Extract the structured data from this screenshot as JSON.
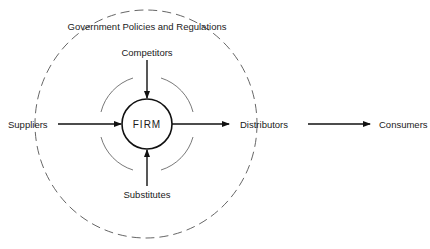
{
  "diagram": {
    "type": "environment-influence-diagram",
    "center": {
      "label": "FIRM"
    },
    "outer_boundary": {
      "label": "Government Policies and Regulations",
      "style": "dashed-circle"
    },
    "nodes": {
      "top": "Competitors",
      "bottom": "Substitutes",
      "left": "Suppliers",
      "right": "Distributors",
      "far_right": "Consumers"
    },
    "edges": [
      {
        "from": "Competitors",
        "to": "FIRM"
      },
      {
        "from": "Substitutes",
        "to": "FIRM"
      },
      {
        "from": "Suppliers",
        "to": "FIRM"
      },
      {
        "from": "FIRM",
        "to": "Distributors"
      },
      {
        "from": "Distributors",
        "to": "Consumers"
      }
    ],
    "colors": {
      "stroke": "#111111",
      "dashed": "#555555",
      "background": "#ffffff"
    }
  }
}
